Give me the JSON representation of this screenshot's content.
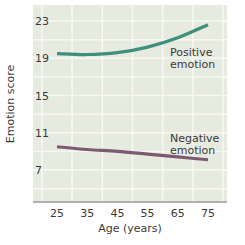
{
  "chart_data": {
    "type": "line",
    "title": "",
    "xlabel": "Age (years)",
    "ylabel": "Emotion score",
    "x": [
      25,
      35,
      45,
      55,
      65,
      75
    ],
    "x_ticks": [
      "25",
      "35",
      "45",
      "55",
      "65",
      "75"
    ],
    "y_ticks": [
      "23",
      "19",
      "15",
      "11",
      "7"
    ],
    "ylim": [
      5.4,
      24.7
    ],
    "xlim": [
      17,
      81
    ],
    "grid": true,
    "legend_position": "inline labels",
    "series": [
      {
        "name": "Positive emotion",
        "label_lines": [
          "Positive",
          "emotion"
        ],
        "color": "#3f8f7c",
        "values": [
          19.5,
          19.4,
          19.6,
          20.2,
          21.2,
          22.6
        ]
      },
      {
        "name": "Negative emotion",
        "label_lines": [
          "Negative",
          "emotion"
        ],
        "color": "#7d5a70",
        "values": [
          9.5,
          9.2,
          9.0,
          8.7,
          8.4,
          8.1
        ]
      }
    ],
    "colors": {
      "plot_background": "#e6eadf",
      "grid": "#f7f8f4",
      "axis": "#9a9a9a"
    }
  }
}
